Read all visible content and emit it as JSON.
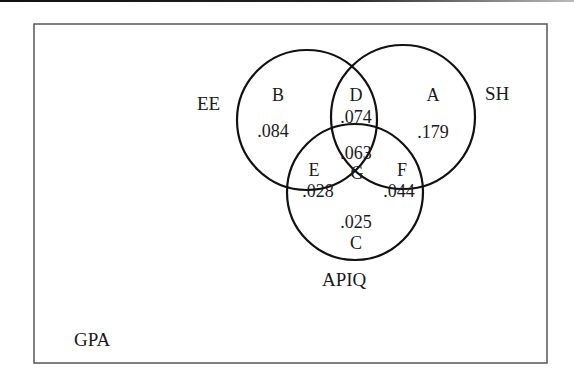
{
  "diagram": {
    "type": "venn",
    "universe": {
      "label": "GPA"
    },
    "sets": [
      {
        "id": "ee",
        "label": "EE"
      },
      {
        "id": "sh",
        "label": "SH"
      },
      {
        "id": "apiq",
        "label": "APIQ"
      }
    ],
    "regions": {
      "b": {
        "letter": "B",
        "value": ".084",
        "membership": "EE only"
      },
      "a": {
        "letter": "A",
        "value": ".179",
        "membership": "SH only"
      },
      "c": {
        "letter": "C",
        "value": ".025",
        "membership": "APIQ only"
      },
      "d": {
        "letter": "D",
        "value": ".074",
        "membership": "EE ∩ SH"
      },
      "e": {
        "letter": "E",
        "value": ".028",
        "membership": "EE ∩ APIQ"
      },
      "f": {
        "letter": "F",
        "value": ".044",
        "membership": "SH ∩ APIQ"
      },
      "g": {
        "letter": "G",
        "value": ".063",
        "membership": "EE ∩ SH ∩ APIQ"
      }
    },
    "colors": {
      "stroke": "#111111",
      "frame": "#555555",
      "text": "#1a1a1a",
      "background": "#ffffff"
    }
  }
}
